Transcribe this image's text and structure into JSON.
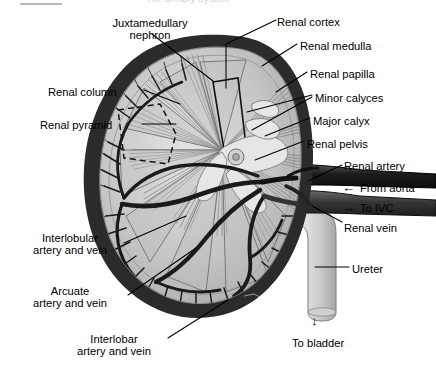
{
  "page_header": {
    "title": "The Urinary System"
  },
  "figure": {
    "colors": {
      "capsule": "#2e2e2e",
      "cortex": "#c9c9c9",
      "medulla": "#b0b0b0",
      "pelvis": "#e2e2e2",
      "artery": "#1c1c1c",
      "vein": "#3b3b3b",
      "ureter": "#d8d8d8",
      "label_text": "#000000",
      "leader_line": "#000000"
    }
  },
  "labels": [
    {
      "id": "juxtamedullary-nephron",
      "text": "Juxtamedullary\nnephron",
      "x": 98,
      "y": 17,
      "align": "center",
      "width": 104
    },
    {
      "id": "renal-cortex",
      "text": "Renal cortex",
      "x": 277,
      "y": 16,
      "align": "left",
      "width": 90
    },
    {
      "id": "renal-medulla",
      "text": "Renal medulla",
      "x": 300,
      "y": 40,
      "align": "left",
      "width": 98
    },
    {
      "id": "renal-papilla",
      "text": "Renal papilla",
      "x": 310,
      "y": 68,
      "align": "left",
      "width": 92
    },
    {
      "id": "minor-calyces",
      "text": "Minor calyces",
      "x": 315,
      "y": 92,
      "align": "left",
      "width": 96
    },
    {
      "id": "major-calyx",
      "text": "Major calyx",
      "x": 313,
      "y": 115,
      "align": "left",
      "width": 84
    },
    {
      "id": "renal-pelvis",
      "text": "Renal pelvis",
      "x": 307,
      "y": 138,
      "align": "left",
      "width": 86
    },
    {
      "id": "renal-artery",
      "text": "Renal artery",
      "x": 344,
      "y": 160,
      "align": "left",
      "width": 86
    },
    {
      "id": "from-aorta",
      "text": "From aorta",
      "x": 360,
      "y": 182,
      "align": "left",
      "width": 76
    },
    {
      "id": "to-ivc",
      "text": "To IVC",
      "x": 360,
      "y": 202,
      "align": "left",
      "width": 52
    },
    {
      "id": "renal-vein",
      "text": "Renal vein",
      "x": 344,
      "y": 222,
      "align": "left",
      "width": 74
    },
    {
      "id": "ureter",
      "text": "Ureter",
      "x": 352,
      "y": 263,
      "align": "left",
      "width": 48
    },
    {
      "id": "renal-column",
      "text": "Renal column",
      "x": 48,
      "y": 86,
      "align": "left",
      "width": 94
    },
    {
      "id": "renal-pyramid",
      "text": "Renal pyramid",
      "x": 40,
      "y": 119,
      "align": "left",
      "width": 100
    },
    {
      "id": "interlobular-vessels",
      "text": "Interlobular\nartery and vein",
      "x": 18,
      "y": 232,
      "align": "center",
      "width": 104
    },
    {
      "id": "arcuate-vessels",
      "text": "Arcuate\nartery and vein",
      "x": 18,
      "y": 285,
      "align": "center",
      "width": 104
    },
    {
      "id": "interlobar-vessels",
      "text": "Interlobar\nartery and vein",
      "x": 62,
      "y": 333,
      "align": "center",
      "width": 104
    },
    {
      "id": "to-bladder",
      "text": "To bladder",
      "x": 292,
      "y": 337,
      "align": "left",
      "width": 76
    }
  ],
  "arrow_markers": [
    {
      "id": "from-aorta-arrow",
      "glyph": "←",
      "direction": "left",
      "x": 342,
      "y": 182
    },
    {
      "id": "to-ivc-arrow",
      "glyph": "→",
      "direction": "right",
      "x": 342,
      "y": 202
    },
    {
      "id": "to-bladder-arrow",
      "glyph": "↓",
      "direction": "down",
      "x": 311,
      "y": 315
    }
  ],
  "leader_lines": [
    {
      "id": "leader-juxtamedullary-nephron",
      "points": "152,34 213,81"
    },
    {
      "id": "leader-renal-cortex",
      "points": "276,20 226,44 226,88"
    },
    {
      "id": "leader-renal-medulla",
      "points": "297,44 262,66"
    },
    {
      "id": "leader-renal-papilla",
      "points": "307,72 276,92"
    },
    {
      "id": "leader-minor-calyces-a",
      "points": "312,95 247,112"
    },
    {
      "id": "leader-minor-calyces-b",
      "points": "312,97 252,130"
    },
    {
      "id": "leader-major-calyx",
      "points": "310,118 265,136"
    },
    {
      "id": "leader-renal-pelvis",
      "points": "304,141 255,160"
    },
    {
      "id": "leader-renal-artery",
      "points": "342,165 308,181"
    },
    {
      "id": "leader-renal-vein",
      "points": "342,222 312,206"
    },
    {
      "id": "leader-ureter",
      "points": "349,267 315,267"
    },
    {
      "id": "leader-renal-column",
      "points": "144,90 180,104"
    },
    {
      "id": "leader-renal-pyramid",
      "points": "142,124 176,124"
    },
    {
      "id": "leader-interlobular",
      "points": "124,243 186,216"
    },
    {
      "id": "leader-arcuate",
      "points": "128,295 196,248"
    },
    {
      "id": "leader-interlobar",
      "points": "168,338 228,300"
    }
  ]
}
